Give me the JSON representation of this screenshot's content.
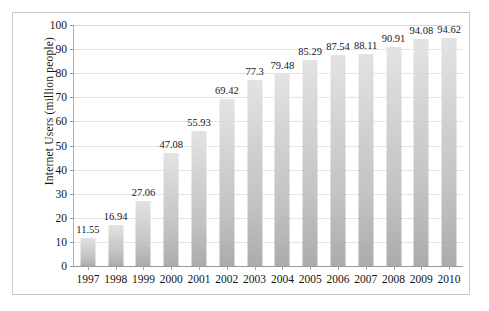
{
  "chart_data": {
    "type": "bar",
    "title": "",
    "subtitle": "",
    "xlabel": "",
    "ylabel": "Internet  Users (million people)",
    "categories": [
      "1997",
      "1998",
      "1999",
      "2000",
      "2001",
      "2002",
      "2003",
      "2004",
      "2005",
      "2006",
      "2007",
      "2008",
      "2009",
      "2010"
    ],
    "values": [
      11.55,
      16.94,
      27.06,
      47.08,
      55.93,
      69.42,
      77.3,
      79.48,
      85.29,
      87.54,
      88.11,
      90.91,
      94.08,
      94.62
    ],
    "value_labels": [
      "11.55",
      "16.94",
      "27.06",
      "47.08",
      "55.93",
      "69.42",
      "77.3",
      "79.48",
      "85.29",
      "87.54",
      "88.11",
      "90.91",
      "94.08",
      "94.62"
    ],
    "ylim": [
      0,
      100
    ],
    "ytick_values": [
      0,
      10,
      20,
      30,
      40,
      50,
      60,
      70,
      80,
      90,
      100
    ],
    "ytick_labels": [
      "0",
      "10",
      "20",
      "30",
      "40",
      "50",
      "60",
      "70",
      "80",
      "90",
      "100"
    ],
    "grid": true,
    "grid_axis": "y",
    "legend": false,
    "legend_position": "none",
    "series": [
      {
        "name": "Internet Users",
        "values": [
          11.55,
          16.94,
          27.06,
          47.08,
          55.93,
          69.42,
          77.3,
          79.48,
          85.29,
          87.54,
          88.11,
          90.91,
          94.08,
          94.62
        ]
      }
    ],
    "colors": {
      "bar_top": "#e3e3e3",
      "bar_bottom": "#ababab",
      "gridline": "#e4e4e4",
      "axis": "#9a9a9a",
      "frame": "#c9c9c9",
      "text": "#151515",
      "background": "#ffffff"
    }
  }
}
